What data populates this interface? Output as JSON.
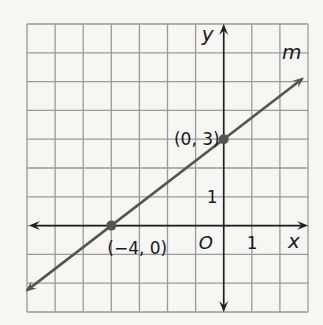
{
  "chart_data": {
    "type": "line",
    "title": "",
    "xlabel": "x",
    "ylabel": "y",
    "xlim": [
      -7,
      3
    ],
    "ylim": [
      -3,
      7
    ],
    "grid": true,
    "origin_label": "O",
    "x_tick_label": "1",
    "y_tick_label": "1",
    "series": [
      {
        "name": "m",
        "slope": 0.75,
        "intercept": 3,
        "x_range": [
          -7,
          2.8
        ],
        "points": [
          {
            "x": 0,
            "y": 3,
            "label": "(0, 3)"
          },
          {
            "x": -4,
            "y": 0,
            "label": "(−4, 0)"
          }
        ]
      }
    ],
    "colors": {
      "grid": "#9a9a9a",
      "axis": "#1f1f1f",
      "line": "#555555",
      "point": "#555555",
      "background": "#f6f6f4"
    }
  }
}
